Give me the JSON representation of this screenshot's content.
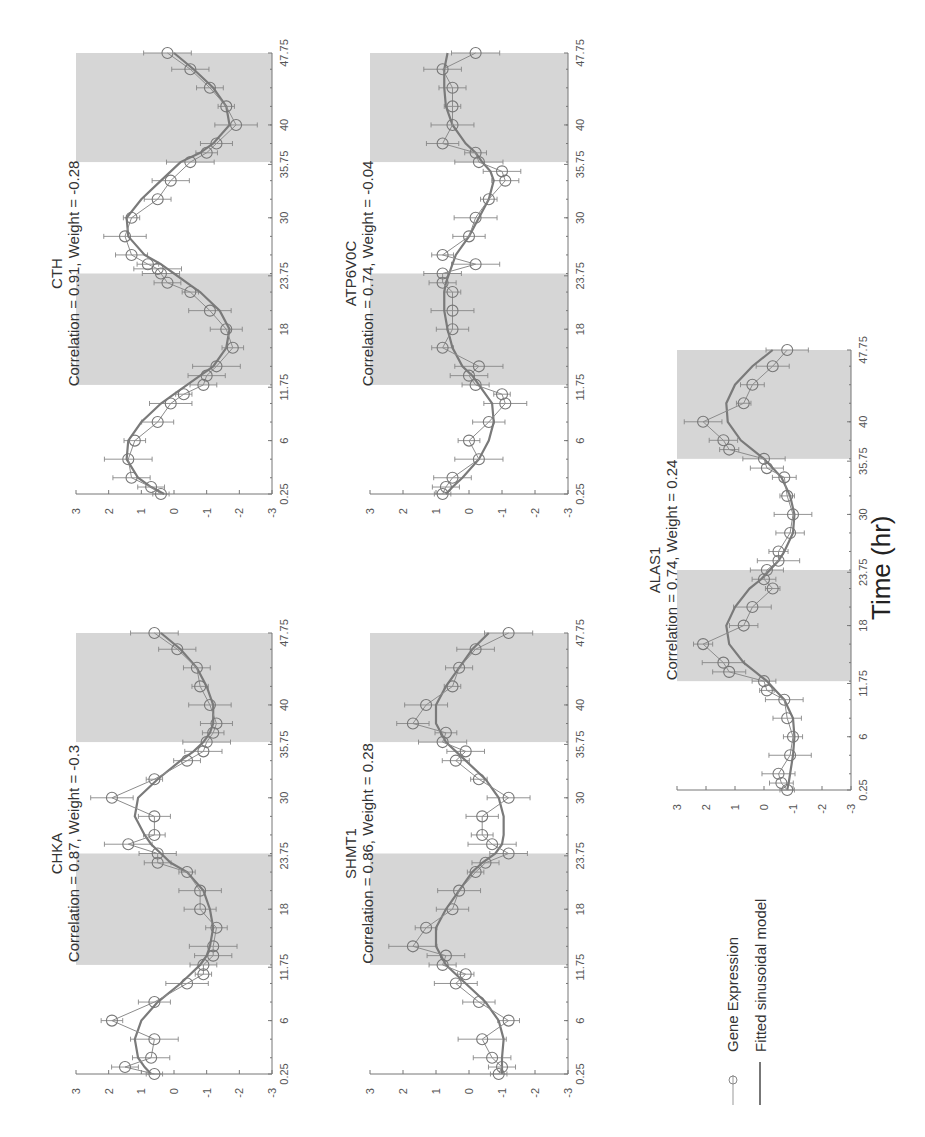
{
  "figure": {
    "xlabel": "Time (hr)",
    "legend": {
      "expression_label": "Gene Expression",
      "fit_label": "Fitted sinusoidal model"
    },
    "colors": {
      "shade": "#d6d6d6",
      "fit": "#7a7a7a",
      "expression": "#8c8c8c"
    }
  },
  "chart_data": [
    {
      "type": "line",
      "gene": "CTH",
      "title": "CTH",
      "subtitle": "Correlation = 0.91, Weight = -0.28",
      "xlabel": "Time (hr)",
      "ylabel": "",
      "xticks": [
        "0.25",
        "6",
        "11.75",
        "18",
        "23.75",
        "30",
        "35.75",
        "40",
        "47.75"
      ],
      "yticks": [
        "3",
        "2",
        "1",
        "0",
        "-1",
        "-2",
        "-3"
      ],
      "ylim": [
        -3,
        3
      ],
      "xlim": [
        0.25,
        47.75
      ],
      "shaded_intervals": [
        [
          12,
          24
        ],
        [
          36,
          47.75
        ]
      ],
      "x": [
        0.25,
        1,
        2,
        4,
        6,
        8,
        10,
        11,
        12,
        13,
        14,
        16,
        18,
        20,
        22,
        23,
        24,
        24.5,
        25,
        26,
        28,
        30,
        32,
        34,
        36,
        37,
        38,
        40,
        42,
        44,
        46,
        47.75
      ],
      "series": [
        {
          "name": "Gene Expression",
          "values": [
            0.4,
            0.7,
            1.3,
            1.4,
            1.2,
            0.5,
            0.1,
            -0.3,
            -0.9,
            -1.0,
            -1.3,
            -1.8,
            -1.6,
            -1.1,
            -0.5,
            0.2,
            0.4,
            0.5,
            0.8,
            1.3,
            1.5,
            1.3,
            0.5,
            0.1,
            -0.5,
            -1.0,
            -1.3,
            -1.9,
            -1.6,
            -1.1,
            -0.5,
            0.2
          ]
        },
        {
          "name": "Fitted sinusoidal model",
          "values": [
            0.3,
            0.7,
            1.1,
            1.45,
            1.4,
            1.0,
            0.4,
            0.0,
            -0.4,
            -0.8,
            -1.2,
            -1.6,
            -1.7,
            -1.4,
            -0.8,
            -0.4,
            0.0,
            0.2,
            0.4,
            0.9,
            1.4,
            1.45,
            1.0,
            0.4,
            -0.2,
            -0.8,
            -1.2,
            -1.7,
            -1.6,
            -1.2,
            -0.6,
            0.0
          ]
        }
      ]
    },
    {
      "type": "line",
      "gene": "ATP6V0C",
      "title": "ATP6V0C",
      "subtitle": "Correlation = 0.74, Weight = -0.04",
      "xlabel": "Time (hr)",
      "ylabel": "",
      "xticks": [
        "0.25",
        "6",
        "11.75",
        "18",
        "23.75",
        "30",
        "35.75",
        "40",
        "47.75"
      ],
      "yticks": [
        "3",
        "2",
        "1",
        "0",
        "-1",
        "-2",
        "-3"
      ],
      "ylim": [
        -3,
        3
      ],
      "xlim": [
        0.25,
        47.75
      ],
      "shaded_intervals": [
        [
          12,
          24
        ],
        [
          36,
          47.75
        ]
      ],
      "x": [
        0.25,
        1,
        2,
        4,
        6,
        8,
        10,
        11,
        12,
        13,
        14,
        16,
        18,
        20,
        22,
        23,
        24,
        25,
        26,
        28,
        30,
        32,
        34,
        35,
        36,
        37,
        38,
        40,
        42,
        44,
        46,
        47.75
      ],
      "series": [
        {
          "name": "Gene Expression",
          "values": [
            0.8,
            0.7,
            0.5,
            -0.3,
            0.0,
            -0.6,
            -1.1,
            -1.0,
            -0.2,
            0.0,
            -0.3,
            0.8,
            0.5,
            0.5,
            0.5,
            0.8,
            0.8,
            -0.2,
            0.8,
            0.0,
            -0.2,
            -0.6,
            -1.1,
            -1.0,
            -0.3,
            -0.2,
            0.8,
            0.5,
            0.5,
            0.5,
            0.8,
            -0.2
          ]
        },
        {
          "name": "Fitted sinusoidal model",
          "values": [
            0.7,
            0.5,
            0.2,
            -0.3,
            -0.6,
            -0.75,
            -0.7,
            -0.5,
            -0.3,
            -0.1,
            0.2,
            0.5,
            0.65,
            0.75,
            0.75,
            0.7,
            0.6,
            0.5,
            0.4,
            0.0,
            -0.3,
            -0.6,
            -0.75,
            -0.65,
            -0.4,
            -0.2,
            0.1,
            0.5,
            0.7,
            0.75,
            0.75,
            0.65
          ]
        }
      ]
    },
    {
      "type": "line",
      "gene": "CHKA",
      "title": "CHKA",
      "subtitle": "Correlation = 0.87, Weight = -0.3",
      "xlabel": "Time (hr)",
      "ylabel": "",
      "xticks": [
        "0.25",
        "6",
        "11.75",
        "18",
        "23.75",
        "30",
        "35.75",
        "40",
        "47.75"
      ],
      "yticks": [
        "3",
        "2",
        "1",
        "0",
        "-1",
        "-2",
        "-3"
      ],
      "ylim": [
        -3,
        3
      ],
      "xlim": [
        0.25,
        47.75
      ],
      "shaded_intervals": [
        [
          12,
          24
        ],
        [
          36,
          47.75
        ]
      ],
      "x": [
        0.25,
        1,
        2,
        4,
        6,
        8,
        10,
        11,
        12,
        13,
        14,
        16,
        18,
        20,
        22,
        23,
        24,
        25,
        26,
        28,
        30,
        32,
        34,
        35,
        36,
        37,
        38,
        40,
        42,
        44,
        46,
        47.75
      ],
      "series": [
        {
          "name": "Gene Expression",
          "values": [
            0.6,
            1.5,
            0.7,
            0.6,
            1.9,
            0.6,
            -0.4,
            -0.9,
            -0.9,
            -1.2,
            -1.2,
            -1.3,
            -0.8,
            -0.8,
            -0.4,
            0.5,
            0.5,
            1.4,
            0.6,
            0.6,
            1.9,
            0.6,
            -0.4,
            -0.9,
            -1.0,
            -1.2,
            -1.3,
            -1.1,
            -0.8,
            -0.7,
            -0.1,
            0.6
          ]
        },
        {
          "name": "Fitted sinusoidal model",
          "values": [
            0.7,
            0.9,
            1.1,
            1.2,
            1.0,
            0.5,
            -0.2,
            -0.5,
            -0.8,
            -1.0,
            -1.1,
            -1.2,
            -1.1,
            -0.9,
            -0.4,
            0.1,
            0.4,
            0.7,
            0.9,
            1.2,
            1.1,
            0.5,
            -0.2,
            -0.6,
            -0.9,
            -1.1,
            -1.2,
            -1.2,
            -1.0,
            -0.7,
            -0.2,
            0.4
          ]
        }
      ]
    },
    {
      "type": "line",
      "gene": "SHMT1",
      "title": "SHMT1",
      "subtitle": "Correlation = 0.86, Weight = 0.28",
      "xlabel": "Time (hr)",
      "ylabel": "",
      "xticks": [
        "0.25",
        "6",
        "11.75",
        "18",
        "23.75",
        "30",
        "35.75",
        "40",
        "47.75"
      ],
      "yticks": [
        "3",
        "2",
        "1",
        "0",
        "-1",
        "-2",
        "-3"
      ],
      "ylim": [
        -3,
        3
      ],
      "xlim": [
        0.25,
        47.75
      ],
      "shaded_intervals": [
        [
          12,
          24
        ],
        [
          36,
          47.75
        ]
      ],
      "x": [
        0.25,
        1,
        2,
        4,
        6,
        8,
        10,
        11,
        12,
        13,
        14,
        16,
        18,
        20,
        22,
        23,
        24,
        25,
        26,
        28,
        30,
        32,
        34,
        35,
        36,
        37,
        38,
        40,
        42,
        44,
        46,
        47.75
      ],
      "series": [
        {
          "name": "Gene Expression",
          "values": [
            -0.9,
            -1.0,
            -0.7,
            -0.4,
            -1.2,
            -0.3,
            0.4,
            0.1,
            0.8,
            0.7,
            1.7,
            1.3,
            0.5,
            0.3,
            -0.2,
            -0.5,
            -1.2,
            -0.7,
            -0.4,
            -0.4,
            -1.2,
            -0.3,
            0.4,
            0.1,
            0.8,
            0.7,
            1.7,
            1.3,
            0.5,
            0.3,
            -0.2,
            -1.2
          ]
        },
        {
          "name": "Fitted sinusoidal model",
          "values": [
            -1.0,
            -1.0,
            -1.0,
            -1.05,
            -0.9,
            -0.5,
            0.1,
            0.4,
            0.7,
            0.85,
            1.0,
            1.0,
            0.7,
            0.3,
            -0.1,
            -0.4,
            -0.8,
            -1.0,
            -1.05,
            -1.05,
            -0.9,
            -0.5,
            0.1,
            0.4,
            0.7,
            0.85,
            1.0,
            1.0,
            0.7,
            0.3,
            -0.1,
            -0.6
          ]
        }
      ]
    },
    {
      "type": "line",
      "gene": "ALAS1",
      "title": "ALAS1",
      "subtitle": "Correlation = 0.74, Weight = 0.24",
      "xlabel": "Time (hr)",
      "ylabel": "",
      "xticks": [
        "0.25",
        "6",
        "11.75",
        "18",
        "23.75",
        "30",
        "35.75",
        "40",
        "47.75"
      ],
      "yticks": [
        "3",
        "2",
        "1",
        "0",
        "-1",
        "-2",
        "-3"
      ],
      "ylim": [
        -3,
        3
      ],
      "xlim": [
        0.25,
        47.75
      ],
      "shaded_intervals": [
        [
          12,
          24
        ],
        [
          36,
          47.75
        ]
      ],
      "x": [
        0.25,
        1,
        2,
        4,
        6,
        8,
        10,
        11,
        12,
        13,
        14,
        16,
        18,
        20,
        22,
        23,
        24,
        25,
        26,
        28,
        30,
        32,
        34,
        35,
        36,
        37,
        38,
        40,
        42,
        44,
        46,
        47.75
      ],
      "series": [
        {
          "name": "Gene Expression",
          "values": [
            -0.8,
            -0.6,
            -0.5,
            -0.9,
            -1.0,
            -0.8,
            -0.7,
            -0.1,
            0.0,
            1.2,
            1.4,
            2.1,
            0.7,
            0.4,
            -0.3,
            0.0,
            -0.1,
            -0.5,
            -0.5,
            -0.9,
            -1.0,
            -0.8,
            -0.7,
            -0.1,
            0.0,
            1.2,
            1.4,
            2.1,
            0.7,
            0.4,
            -0.3,
            -0.8
          ]
        },
        {
          "name": "Fitted sinusoidal model",
          "values": [
            -0.8,
            -0.85,
            -0.9,
            -1.0,
            -1.05,
            -1.0,
            -0.7,
            -0.4,
            -0.1,
            0.3,
            0.7,
            1.2,
            1.3,
            1.0,
            0.5,
            0.1,
            -0.2,
            -0.5,
            -0.7,
            -1.0,
            -1.05,
            -0.9,
            -0.6,
            -0.3,
            0.0,
            0.4,
            0.8,
            1.25,
            1.3,
            1.0,
            0.4,
            -0.3
          ]
        }
      ]
    }
  ]
}
